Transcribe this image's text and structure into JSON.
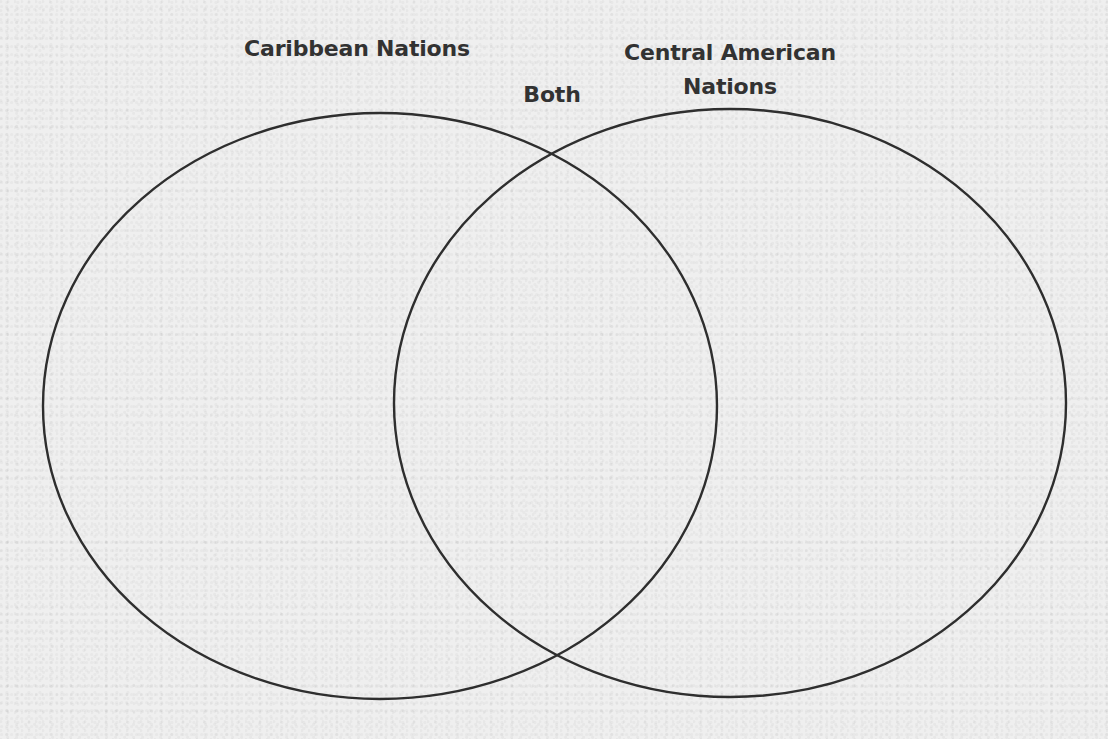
{
  "diagram": {
    "type": "venn",
    "sets": [
      {
        "id": "left",
        "label": "Caribbean Nations",
        "items": []
      },
      {
        "id": "right",
        "label_line1": "Central American",
        "label_line2": "Nations",
        "items": []
      }
    ],
    "intersection": {
      "label": "Both",
      "items": []
    },
    "colors": {
      "stroke": "#2e2e2e",
      "text": "#323232",
      "background": "#efefef"
    }
  }
}
